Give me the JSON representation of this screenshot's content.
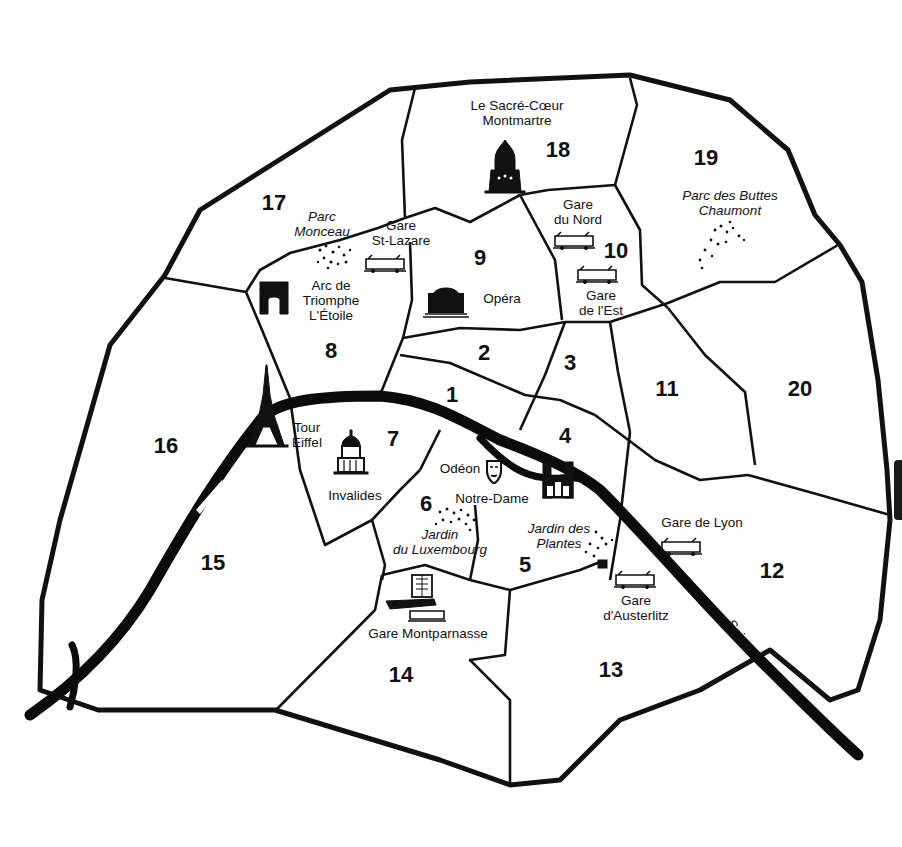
{
  "map": {
    "title": "Paris arrondissements",
    "colors": {
      "ink": "#111111",
      "paper": "#ffffff"
    },
    "arrondissements": [
      {
        "num": "1",
        "x": 452,
        "y": 402
      },
      {
        "num": "2",
        "x": 484,
        "y": 360
      },
      {
        "num": "3",
        "x": 570,
        "y": 370
      },
      {
        "num": "4",
        "x": 565,
        "y": 443
      },
      {
        "num": "5",
        "x": 525,
        "y": 572
      },
      {
        "num": "6",
        "x": 426,
        "y": 511
      },
      {
        "num": "7",
        "x": 393,
        "y": 446
      },
      {
        "num": "8",
        "x": 331,
        "y": 358
      },
      {
        "num": "9",
        "x": 480,
        "y": 265
      },
      {
        "num": "10",
        "x": 616,
        "y": 258
      },
      {
        "num": "11",
        "x": 667,
        "y": 396
      },
      {
        "num": "12",
        "x": 772,
        "y": 578
      },
      {
        "num": "13",
        "x": 611,
        "y": 677
      },
      {
        "num": "14",
        "x": 401,
        "y": 682
      },
      {
        "num": "15",
        "x": 213,
        "y": 570
      },
      {
        "num": "16",
        "x": 166,
        "y": 453
      },
      {
        "num": "17",
        "x": 274,
        "y": 210
      },
      {
        "num": "18",
        "x": 558,
        "y": 157
      },
      {
        "num": "19",
        "x": 706,
        "y": 165
      },
      {
        "num": "20",
        "x": 800,
        "y": 396
      }
    ],
    "landmarks": [
      {
        "id": "sacre-coeur",
        "lines": [
          "Le Sacré-Cœur",
          "Montmartre"
        ],
        "x": 517,
        "y": 110,
        "italic": false,
        "icon": "basilica-icon"
      },
      {
        "id": "parc-monceau",
        "lines": [
          "Parc",
          "Monceau"
        ],
        "x": 322,
        "y": 221,
        "italic": true,
        "icon": "park-icon"
      },
      {
        "id": "gare-st-lazare",
        "lines": [
          "Gare",
          "St-Lazare"
        ],
        "x": 401,
        "y": 230,
        "italic": false,
        "icon": "train-icon"
      },
      {
        "id": "arc-de-triomphe",
        "lines": [
          "Arc de",
          "Triomphe",
          "L'Étoile"
        ],
        "x": 331,
        "y": 290,
        "italic": false,
        "icon": "arch-icon"
      },
      {
        "id": "opera",
        "lines": [
          "Opéra"
        ],
        "x": 502,
        "y": 303,
        "italic": false,
        "icon": "opera-icon"
      },
      {
        "id": "gare-du-nord",
        "lines": [
          "Gare",
          "du Nord"
        ],
        "x": 578,
        "y": 209,
        "italic": false,
        "icon": "train-icon"
      },
      {
        "id": "gare-de-l-est",
        "lines": [
          "Gare",
          "de l'Est"
        ],
        "x": 601,
        "y": 300,
        "italic": false,
        "icon": "train-icon"
      },
      {
        "id": "buttes-chaumont",
        "lines": [
          "Parc des Buttes",
          "Chaumont"
        ],
        "x": 730,
        "y": 200,
        "italic": true,
        "icon": "park-icon"
      },
      {
        "id": "tour-eiffel",
        "lines": [
          "Tour",
          "Eiffel"
        ],
        "x": 307,
        "y": 432,
        "italic": false,
        "icon": "eiffel-tower-icon"
      },
      {
        "id": "invalides",
        "lines": [
          "Invalides"
        ],
        "x": 355,
        "y": 500,
        "italic": false,
        "icon": "dome-icon"
      },
      {
        "id": "odeon",
        "lines": [
          "Odéon"
        ],
        "x": 460,
        "y": 473,
        "italic": false,
        "icon": "theatre-mask-icon"
      },
      {
        "id": "notre-dame",
        "lines": [
          "Notre-Dame"
        ],
        "x": 492,
        "y": 503,
        "italic": false,
        "icon": "cathedral-icon"
      },
      {
        "id": "luxembourg",
        "lines": [
          "Jardin",
          "du Luxembourg"
        ],
        "x": 440,
        "y": 539,
        "italic": true,
        "icon": "park-icon"
      },
      {
        "id": "jardin-des-plantes",
        "lines": [
          "Jardin des",
          "Plantes"
        ],
        "x": 559,
        "y": 533,
        "italic": true,
        "icon": "park-icon"
      },
      {
        "id": "gare-de-lyon",
        "lines": [
          "Gare de Lyon"
        ],
        "x": 702,
        "y": 527,
        "italic": false,
        "icon": "train-icon"
      },
      {
        "id": "gare-d-austerlitz",
        "lines": [
          "Gare",
          "d'Austerlitz"
        ],
        "x": 636,
        "y": 605,
        "italic": false,
        "icon": "train-icon"
      },
      {
        "id": "gare-montparnasse",
        "lines": [
          "Gare Montparnasse"
        ],
        "x": 428,
        "y": 638,
        "italic": false,
        "icon": "tower-train-icon"
      }
    ],
    "river": {
      "name": "Seine"
    }
  }
}
